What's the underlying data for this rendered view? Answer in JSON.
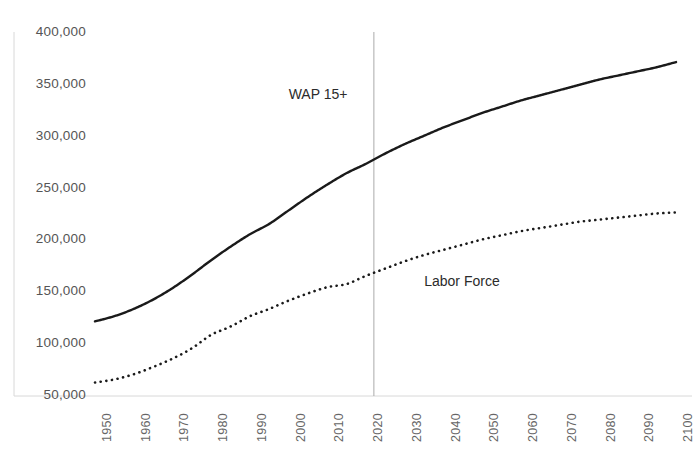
{
  "chart_data": {
    "type": "line",
    "title": "",
    "subtitle": "",
    "xlabel": "",
    "ylabel": "",
    "grid": false,
    "legend_position": "inline-annotation",
    "xlim": [
      1950,
      2100
    ],
    "ylim": [
      50000,
      400000
    ],
    "y_ticks": [
      50000,
      100000,
      150000,
      200000,
      250000,
      300000,
      350000,
      400000
    ],
    "y_tick_labels": [
      "50,000",
      "100,000",
      "150,000",
      "200,000",
      "250,000",
      "300,000",
      "350,000",
      "400,000"
    ],
    "x_ticks": [
      1950,
      1960,
      1970,
      1980,
      1990,
      2000,
      2010,
      2020,
      2030,
      2040,
      2050,
      2060,
      2070,
      2080,
      2090,
      2100
    ],
    "x_tick_labels": [
      "1950",
      "1960",
      "1970",
      "1980",
      "1990",
      "2000",
      "2010",
      "2020",
      "2030",
      "2040",
      "2050",
      "2060",
      "2070",
      "2080",
      "2090",
      "2100"
    ],
    "annotations": [
      {
        "text": "WAP 15+",
        "x": 2000,
        "y": 340000
      },
      {
        "text": "Labor Force",
        "x": 2035,
        "y": 160000
      }
    ],
    "reference_line": {
      "x": 2022,
      "label": "",
      "color": "#aaaaaa"
    },
    "x": [
      1950,
      1955,
      1960,
      1965,
      1970,
      1975,
      1980,
      1985,
      1990,
      1995,
      2000,
      2005,
      2010,
      2015,
      2020,
      2025,
      2030,
      2035,
      2040,
      2045,
      2050,
      2055,
      2060,
      2065,
      2070,
      2075,
      2080,
      2085,
      2090,
      2095,
      2100
    ],
    "series": [
      {
        "name": "WAP 15+",
        "style": "solid",
        "color": "#1a1a1a",
        "values": [
          121000,
          126000,
          133000,
          142000,
          153000,
          166000,
          180000,
          193000,
          205000,
          215000,
          228000,
          241000,
          253000,
          264000,
          273000,
          283000,
          292000,
          300000,
          308000,
          315000,
          322000,
          328000,
          334000,
          339000,
          344000,
          349000,
          354000,
          358000,
          362000,
          366000,
          371000
        ]
      },
      {
        "name": "Labor Force",
        "style": "dotted",
        "color": "#1a1a1a",
        "values": [
          62000,
          65000,
          70000,
          77000,
          85000,
          95000,
          108000,
          116000,
          126000,
          133000,
          141000,
          148000,
          154000,
          157000,
          165000,
          172000,
          179000,
          185000,
          190000,
          195000,
          200000,
          204000,
          208000,
          211000,
          214000,
          217000,
          219000,
          221000,
          223000,
          225000,
          226000
        ]
      }
    ]
  }
}
